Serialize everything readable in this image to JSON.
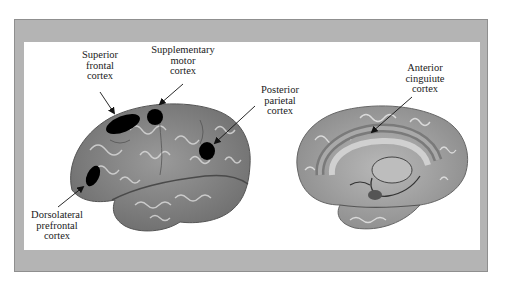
{
  "figure": {
    "background_color": "#ffffff",
    "frame_color": "#b4b4b4",
    "panel_color": "#ffffff",
    "highlight_color": "#000000"
  },
  "left_brain": {
    "view": "lateral",
    "labels": [
      {
        "id": "superior-frontal",
        "lines": [
          "Superior",
          "frontal",
          "cortex"
        ]
      },
      {
        "id": "supplementary-motor",
        "lines": [
          "Supplementary",
          "motor",
          "cortex"
        ]
      },
      {
        "id": "posterior-parietal",
        "lines": [
          "Posterior",
          "parietal",
          "cortex"
        ]
      },
      {
        "id": "dorsolateral-prefrontal",
        "lines": [
          "Dorsolateral",
          "prefrontal",
          "cortex"
        ]
      }
    ]
  },
  "right_brain": {
    "view": "medial",
    "labels": [
      {
        "id": "anterior-cingulate",
        "lines": [
          "Anterior",
          "cinguiute",
          "cortex"
        ]
      }
    ]
  }
}
